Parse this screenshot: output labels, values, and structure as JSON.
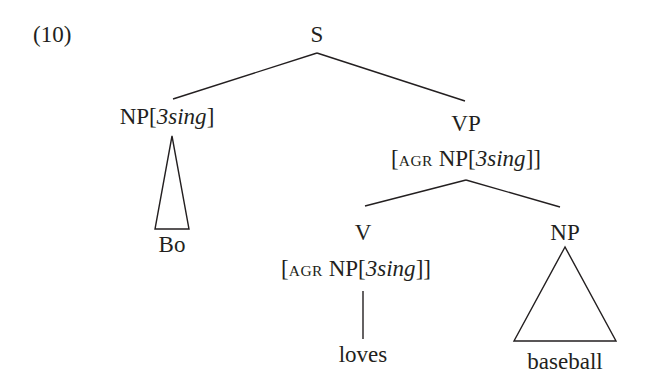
{
  "example_number": "(10)",
  "tree": {
    "root": {
      "label": "S"
    },
    "subject": {
      "label": "NP",
      "feature_open": "[",
      "feature": "3sing",
      "feature_close": "]",
      "leaf": "Bo",
      "leaf_style": "triangle"
    },
    "vp": {
      "label": "VP",
      "agr_open": "[",
      "agr_key": "agr",
      "agr_np": "NP",
      "agr_feature_open": "[",
      "agr_feature": "3sing",
      "agr_close": "]]",
      "verb": {
        "label": "V",
        "agr_open": "[",
        "agr_key": "agr",
        "agr_np": "NP",
        "agr_feature_open": "[",
        "agr_feature": "3sing",
        "agr_close": "]]",
        "leaf": "loves",
        "leaf_style": "line"
      },
      "object": {
        "label": "NP",
        "leaf": "baseball",
        "leaf_style": "triangle"
      }
    }
  },
  "colors": {
    "ink": "#231f20",
    "background": "#ffffff"
  }
}
